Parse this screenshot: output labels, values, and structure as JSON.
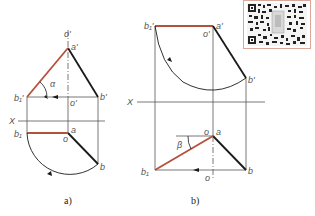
{
  "diagram": {
    "type": "descriptive-geometry-rotation",
    "colors": {
      "original_line": "#1a1a1a",
      "true_length_line": "#b5503a",
      "construction": "#555555",
      "qr_border": "#d9a89a"
    },
    "panel_a": {
      "caption": "a)",
      "labels": {
        "o_prime_top": "o'",
        "a_prime": "a'",
        "b1_prime": "b₁'",
        "b_prime": "b'",
        "o_prime_mid": "o'",
        "alpha": "α",
        "axis_x": "X",
        "b1": "b₁",
        "a": "a",
        "o": "o",
        "b": "b"
      }
    },
    "panel_b": {
      "caption": "b)",
      "labels": {
        "b1_prime": "b₁'",
        "a_prime": "a'",
        "o_prime": "o'",
        "b_prime": "b'",
        "axis_x": "X",
        "o": "o",
        "a": "a",
        "beta": "β",
        "b1": "b₁",
        "b": "b",
        "o_bottom": "o"
      }
    },
    "qr_code": {
      "icon": "qr-code-icon"
    }
  }
}
